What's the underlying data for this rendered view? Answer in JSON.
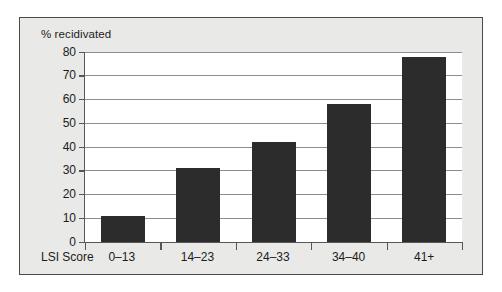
{
  "chart_data": {
    "type": "bar",
    "title": "",
    "xlabel": "LSI Score",
    "ylabel": "% recidivated",
    "categories": [
      "0–13",
      "14–23",
      "24–33",
      "34–40",
      "41+"
    ],
    "values": [
      11,
      31,
      42,
      58,
      78
    ],
    "ylim": [
      0,
      80
    ],
    "yticks": [
      0,
      10,
      20,
      30,
      40,
      50,
      60,
      70,
      80
    ],
    "ytick_labels": [
      "0",
      "10",
      "20",
      "30",
      "40",
      "50",
      "60",
      "70",
      "80"
    ],
    "grid": true,
    "legend": "none",
    "bar_color": "#2c2c2c",
    "plot_background": "#ffffff",
    "figure_background": "#e9e9e7",
    "axis_color": "#57575a",
    "gridline_color": "#8d8d90"
  }
}
